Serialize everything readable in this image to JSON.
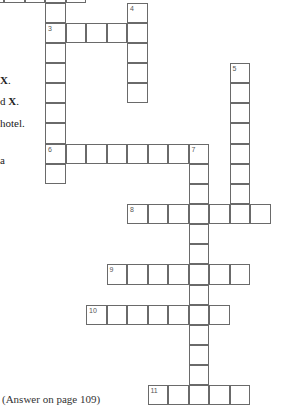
{
  "puzzle": {
    "answer_note": "(Answer on page 109)",
    "clue_fragments": [
      {
        "text": "X.",
        "bold_part": "X"
      },
      {
        "text": "d X.",
        "bold_part": "X"
      },
      {
        "text": "hotel.",
        "bold_part": ""
      },
      {
        "text": "a",
        "bold_part": ""
      }
    ],
    "entries": [
      {
        "number": null,
        "direction": "across",
        "row": -1,
        "col": 0,
        "length": 5,
        "partial": true
      },
      {
        "number": 3,
        "direction": "across",
        "row": 1,
        "col": 2,
        "length": 5
      },
      {
        "number": 3,
        "direction": "down",
        "row": 1,
        "col": 2,
        "length": 8
      },
      {
        "number": 4,
        "direction": "down",
        "row": 0,
        "col": 6,
        "length": 5
      },
      {
        "number": 5,
        "direction": "down",
        "row": 3,
        "col": 11,
        "length": 8
      },
      {
        "number": 6,
        "direction": "across",
        "row": 7,
        "col": 2,
        "length": 8
      },
      {
        "number": 7,
        "direction": "down",
        "row": 7,
        "col": 9,
        "length": 13
      },
      {
        "number": 8,
        "direction": "across",
        "row": 10,
        "col": 6,
        "length": 7
      },
      {
        "number": 9,
        "direction": "across",
        "row": 13,
        "col": 5,
        "length": 7
      },
      {
        "number": 10,
        "direction": "across",
        "row": 15,
        "col": 4,
        "length": 7
      },
      {
        "number": 11,
        "direction": "across",
        "row": 19,
        "col": 7,
        "length": 5
      }
    ],
    "extra_columns_above": [
      {
        "row": 0,
        "col": 2,
        "length": 1
      }
    ]
  }
}
